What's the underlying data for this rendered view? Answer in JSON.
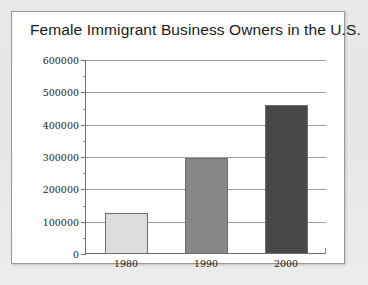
{
  "card": {
    "title": "Female Immigrant Business Owners in the U.S."
  },
  "chart_data": {
    "type": "bar",
    "title": "Female Immigrant Business Owners in the U.S.",
    "xlabel": "",
    "ylabel": "",
    "categories": [
      "1980",
      "1990",
      "2000"
    ],
    "values": [
      128000,
      297000,
      462000
    ],
    "bar_colors": [
      "#dcdcdc",
      "#878787",
      "#484848"
    ],
    "bar_border_color": "#6d6d6d",
    "ylim": [
      0,
      600000
    ],
    "ytick_labels": [
      "600000",
      "500000",
      "400000",
      "300000",
      "200000",
      "100000",
      "0"
    ],
    "ytick_values": [
      600000,
      500000,
      400000,
      300000,
      200000,
      100000,
      0
    ],
    "yminor_step": 50000,
    "grid": true,
    "gridline_color": "#9d9d9d",
    "legend": "none",
    "legend_position": "none",
    "axis_color": "#6f6f6f",
    "background": "#fdfdfd"
  }
}
